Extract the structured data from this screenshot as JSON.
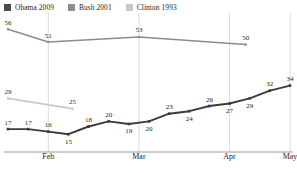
{
  "legend": {
    "items": [
      {
        "label": "Obama 2009",
        "color": "#4a4a4a",
        "swatch_name": "legend-swatch-obama"
      },
      {
        "label": "Bush 2001",
        "color": "#8d8d8d",
        "swatch_name": "legend-swatch-bush"
      },
      {
        "label": "Clinton 1993",
        "color": "#c7c7c7",
        "swatch_name": "legend-swatch-clinton"
      }
    ]
  },
  "axis": {
    "xticks": [
      "Feb",
      "Mar",
      "Apr",
      "May"
    ]
  },
  "chart_data": {
    "type": "line",
    "title": "",
    "subtitle": "",
    "xlabel": "",
    "ylabel": "",
    "grid": "vertical",
    "legend_position": "top-left",
    "xlim": [
      0,
      14
    ],
    "ylim": [
      10,
      60
    ],
    "x_tick_labels": [
      "Feb",
      "Mar",
      "Apr",
      "May"
    ],
    "x_tick_positions": [
      2,
      6.5,
      11,
      14
    ],
    "series": [
      {
        "name": "Obama 2009",
        "color": "#3b3b3b",
        "x": [
          0,
          1,
          2,
          3,
          4,
          5,
          6,
          7,
          8,
          9,
          10,
          11,
          12,
          13,
          14
        ],
        "values": [
          17,
          17,
          16,
          15,
          18,
          20,
          19,
          20,
          23,
          24,
          26,
          27,
          29,
          32,
          34
        ],
        "label_side": [
          "above",
          "above",
          "above",
          "below",
          "above",
          "above",
          "below",
          "below",
          "above",
          "below",
          "above",
          "below",
          "below",
          "above",
          "above"
        ]
      },
      {
        "name": "Bush 2001",
        "color": "#8d8d8d",
        "x": [
          0,
          2,
          6.5,
          11.8
        ],
        "values": [
          56,
          51,
          53,
          50
        ],
        "label_side": [
          "above",
          "above",
          "above",
          "above"
        ]
      },
      {
        "name": "Clinton 1993",
        "color": "#c9c9c9",
        "x": [
          0,
          3.2
        ],
        "values": [
          29,
          25
        ],
        "label_side": [
          "above",
          "above"
        ]
      }
    ]
  }
}
